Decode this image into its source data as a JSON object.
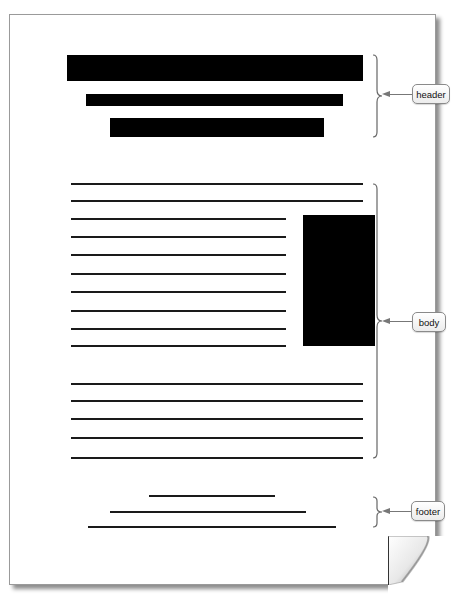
{
  "diagram": {
    "type": "document-layout",
    "sections": [
      {
        "id": "header",
        "label": "header"
      },
      {
        "id": "body",
        "label": "body"
      },
      {
        "id": "footer",
        "label": "footer"
      }
    ],
    "colors": {
      "ink": "#000000",
      "page": "#ffffff",
      "callout_border": "#8a8a8a",
      "arrow": "#777777"
    }
  },
  "labels": {
    "header": "header",
    "body": "body",
    "footer": "footer"
  }
}
